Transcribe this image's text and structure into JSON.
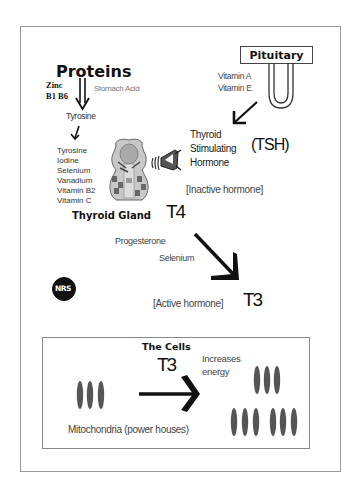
{
  "diagram": {
    "proteins": {
      "title": "Proteins",
      "cofactors": [
        "Zinc",
        "B1 B6"
      ],
      "side_label": "Stomach Acid",
      "product": "Tyrosine"
    },
    "thyroid_inputs": [
      "Tyrosine",
      "Iodine",
      "Selenium",
      "Vanadium",
      "Vitamin B2",
      "Vitamin C"
    ],
    "thyroid_gland_label": "Thyroid Gland",
    "t4_label": "T4",
    "pituitary": {
      "label": "Pituitary",
      "vitamins": [
        "Vitamin A",
        "Vitamin E"
      ]
    },
    "tsh": {
      "lines": [
        "Thyroid",
        "Stimulating",
        "Hormone"
      ],
      "abbrev": "(TSH)"
    },
    "inactive_label": "[Inactive hormone]",
    "conversion_factors": [
      "Progesterone",
      "Selenium"
    ],
    "active_label": "[Active hormone]",
    "t3_label": "T3",
    "logo_text": "NRS",
    "cells": {
      "title": "The Cells",
      "t3_label": "T3",
      "effect_lines": [
        "Increases",
        "energy"
      ],
      "mitochondria_label": "Mitochondria (power houses)"
    },
    "colors": {
      "text": "#222222",
      "mitochondria": "#555555",
      "border": "#9a9a9a",
      "arrow": "#111111"
    }
  }
}
